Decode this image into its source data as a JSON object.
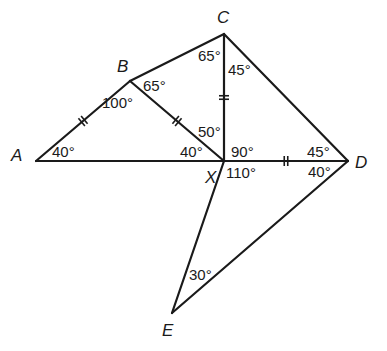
{
  "diagram": {
    "type": "geometry-figure",
    "vertices": [
      {
        "id": "A",
        "label": "A",
        "x": 36,
        "y": 161,
        "lx": 11,
        "ly": 161
      },
      {
        "id": "B",
        "label": "B",
        "x": 130,
        "y": 81,
        "lx": 117,
        "ly": 72
      },
      {
        "id": "C",
        "label": "C",
        "x": 224,
        "y": 34,
        "lx": 217,
        "ly": 23
      },
      {
        "id": "X",
        "label": "X",
        "x": 224,
        "y": 161,
        "lx": 205,
        "ly": 183
      },
      {
        "id": "D",
        "label": "D",
        "x": 348,
        "y": 161,
        "lx": 355,
        "ly": 168
      },
      {
        "id": "E",
        "label": "E",
        "x": 172,
        "y": 313,
        "lx": 162,
        "ly": 336
      }
    ],
    "edges": [
      {
        "from": "A",
        "to": "B"
      },
      {
        "from": "B",
        "to": "C"
      },
      {
        "from": "C",
        "to": "D"
      },
      {
        "from": "A",
        "to": "D"
      },
      {
        "from": "B",
        "to": "X"
      },
      {
        "from": "C",
        "to": "X"
      },
      {
        "from": "X",
        "to": "E"
      },
      {
        "from": "D",
        "to": "E"
      }
    ],
    "equal_marks": [
      {
        "segment": "AB",
        "marks": 2
      },
      {
        "segment": "BX",
        "marks": 2
      },
      {
        "segment": "CX",
        "marks": 2
      },
      {
        "segment": "XD",
        "marks": 2
      }
    ],
    "angles": [
      {
        "at": "A",
        "text": "40°",
        "x": 52,
        "y": 157
      },
      {
        "at": "B",
        "text": "100°",
        "x": 102,
        "y": 108,
        "note": "angle ABX"
      },
      {
        "at": "B",
        "text": "65°",
        "x": 143,
        "y": 91,
        "note": "angle CBX"
      },
      {
        "at": "C",
        "text": "65°",
        "x": 198,
        "y": 61,
        "note": "angle BCX"
      },
      {
        "at": "C",
        "text": "45°",
        "x": 228,
        "y": 75,
        "note": "angle XCD"
      },
      {
        "at": "X",
        "text": "50°",
        "x": 198,
        "y": 137,
        "note": "angle BXC"
      },
      {
        "at": "X",
        "text": "40°",
        "x": 180,
        "y": 157,
        "note": "angle AXB"
      },
      {
        "at": "X",
        "text": "90°",
        "x": 231,
        "y": 157,
        "note": "angle CXD"
      },
      {
        "at": "X",
        "text": "110°",
        "x": 226,
        "y": 178,
        "note": "angle DXE"
      },
      {
        "at": "D",
        "text": "45°",
        "x": 307,
        "y": 157,
        "note": "angle CDX"
      },
      {
        "at": "D",
        "text": "40°",
        "x": 308,
        "y": 177,
        "note": "angle XDE"
      },
      {
        "at": "E",
        "text": "30°",
        "x": 189,
        "y": 280
      }
    ]
  }
}
